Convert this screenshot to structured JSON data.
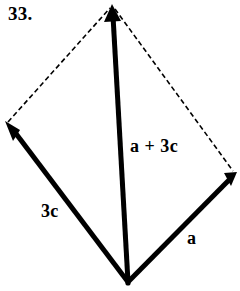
{
  "figure": {
    "problem_number": "33.",
    "colors": {
      "ink": "#000000",
      "background": "#ffffff"
    },
    "labels": {
      "sum_vector": "a + 3c",
      "side_vector_left": "3c",
      "side_vector_right": "a"
    },
    "geometry": {
      "vertices": {
        "top": {
          "x": 112,
          "y": 5
        },
        "left": {
          "x": 7,
          "y": 124
        },
        "right": {
          "x": 235,
          "y": 175
        },
        "bottom": {
          "x": 128,
          "y": 284
        }
      },
      "solid_vectors": [
        {
          "name": "3c",
          "from": "bottom",
          "to": "left",
          "arrow_at": "to",
          "stroke_width": 5
        },
        {
          "name": "a",
          "from": "bottom",
          "to": "right",
          "arrow_at": "to",
          "stroke_width": 5
        },
        {
          "name": "a + 3c",
          "from": "bottom",
          "to": "top",
          "arrow_at": "to",
          "stroke_width": 5
        }
      ],
      "dashed_edges": [
        {
          "from": "left",
          "to": "top",
          "stroke_width": 1.6
        },
        {
          "from": "top",
          "to": "right",
          "stroke_width": 1.6
        }
      ],
      "dash_pattern": "5 3"
    }
  }
}
